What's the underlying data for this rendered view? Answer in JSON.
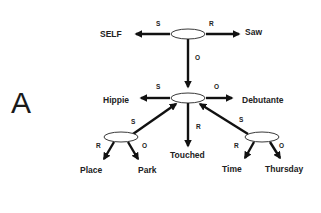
{
  "panel_label": "A",
  "colors": {
    "line": "#111111",
    "text": "#222222",
    "background": "#ffffff"
  },
  "nodes": {
    "top": {
      "type": "ellipse"
    },
    "middle": {
      "type": "ellipse"
    },
    "left_sub": {
      "type": "ellipse"
    },
    "right_sub": {
      "type": "ellipse"
    },
    "self": {
      "label": "SELF"
    },
    "saw": {
      "label": "Saw"
    },
    "hippie": {
      "label": "Hippie"
    },
    "debutante": {
      "label": "Debutante"
    },
    "touched": {
      "label": "Touched"
    },
    "place": {
      "label": "Place"
    },
    "park": {
      "label": "Park"
    },
    "time": {
      "label": "Time"
    },
    "thursday": {
      "label": "Thursday"
    }
  },
  "edges": [
    {
      "from": "top",
      "to": "self",
      "label": "S"
    },
    {
      "from": "top",
      "to": "saw",
      "label": "R"
    },
    {
      "from": "top",
      "to": "middle",
      "label": "O"
    },
    {
      "from": "middle",
      "to": "hippie",
      "label": "S"
    },
    {
      "from": "middle",
      "to": "debutante",
      "label": "O"
    },
    {
      "from": "middle",
      "to": "touched",
      "label": "R"
    },
    {
      "from": "left_sub",
      "to": "middle",
      "label": "S"
    },
    {
      "from": "left_sub",
      "to": "place",
      "label": "R"
    },
    {
      "from": "left_sub",
      "to": "park",
      "label": "O"
    },
    {
      "from": "right_sub",
      "to": "middle",
      "label": "S"
    },
    {
      "from": "right_sub",
      "to": "time",
      "label": "R"
    },
    {
      "from": "right_sub",
      "to": "thursday",
      "label": "O"
    }
  ]
}
